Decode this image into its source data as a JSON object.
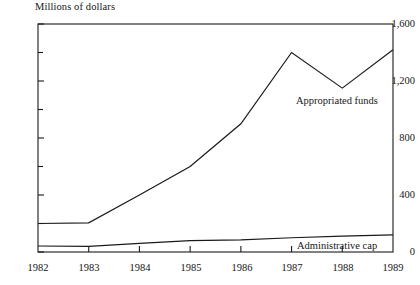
{
  "chart_data": {
    "type": "line",
    "title": "",
    "ylabel": "Millions of dollars",
    "xlabel": "",
    "x": [
      1982,
      1983,
      1984,
      1985,
      1986,
      1987,
      1988,
      1989
    ],
    "categories": [
      "1982",
      "1983",
      "1984",
      "1985",
      "1986",
      "1987",
      "1988",
      "1989"
    ],
    "series": [
      {
        "name": "Appropriated funds",
        "values": [
          200,
          205,
          400,
          600,
          900,
          1400,
          1150,
          1420
        ]
      },
      {
        "name": "Administrative cap",
        "values": [
          42,
          40,
          60,
          80,
          85,
          100,
          112,
          120
        ]
      }
    ],
    "ylim": [
      0,
      1600
    ],
    "yticks": [
      0,
      400,
      800,
      1200,
      1600
    ],
    "ytick_labels": [
      "0",
      "400",
      "800",
      "1,200",
      "1,600"
    ],
    "yminor_ticks": [
      200,
      600,
      1000,
      1400
    ],
    "xlim": [
      1982,
      1989
    ],
    "grid": false,
    "legend": "inline-annotations",
    "line_color": "#1a1a1a",
    "axis_color": "#1a1a1a",
    "background": "#ffffff"
  },
  "axis": {
    "y_title": "Millions of dollars",
    "y_labels": [
      "1,600",
      "1,200",
      "800",
      "400",
      "0"
    ],
    "x_labels": [
      "1982",
      "1983",
      "1984",
      "1985",
      "1986",
      "1987",
      "1988",
      "1989"
    ]
  },
  "annotations": {
    "appropriated_funds": "Appropriated funds",
    "administrative_cap": "Administrative cap"
  }
}
